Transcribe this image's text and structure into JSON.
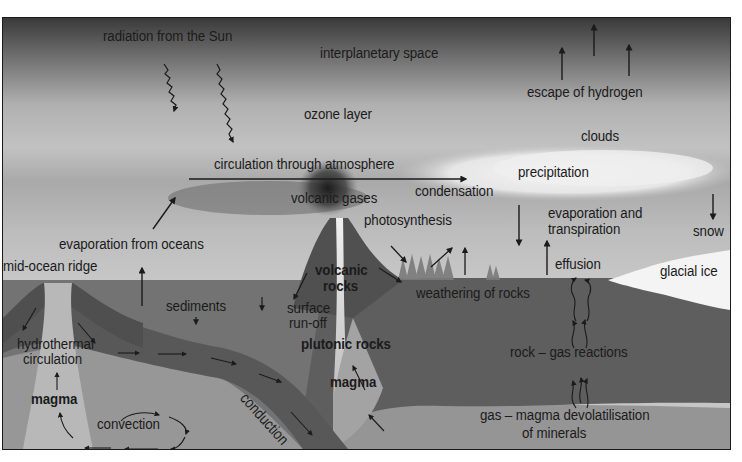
{
  "diagram": {
    "layers": {
      "space": "interplanetary space",
      "ozone": "ozone layer",
      "clouds": "clouds"
    },
    "atmosphere_labels": {
      "radiation": "radiation from the Sun",
      "escape": "escape of hydrogen",
      "circulation": "circulation through atmosphere",
      "volcanic_gases": "volcanic gases",
      "condensation": "condensation",
      "precipitation": "precipitation",
      "photosynthesis": "photosynthesis",
      "evaporation_transpiration_1": "evaporation and",
      "evaporation_transpiration_2": "transpiration",
      "snow": "snow",
      "evaporation_oceans": "evaporation from oceans"
    },
    "surface_labels": {
      "mid_ocean_ridge": "mid-ocean ridge",
      "effusion": "effusion",
      "glacial_ice": "glacial ice",
      "weathering": "weathering of rocks",
      "sediments": "sediments",
      "surface_runoff_1": "surface",
      "surface_runoff_2": "run-off"
    },
    "interior_labels": {
      "volcanic_rocks_1": "volcanic",
      "volcanic_rocks_2": "rocks",
      "plutonic_rocks": "plutonic rocks",
      "magma_center": "magma",
      "magma_left": "magma",
      "hydrothermal_1": "hydrothermal",
      "hydrothermal_2": "circulation",
      "convection": "convection",
      "conduction": "conduction",
      "rock_gas": "rock – gas reactions",
      "gas_magma_1": "gas – magma devolatilisation",
      "gas_magma_2": "of minerals"
    },
    "colors": {
      "space_top": "#3a3a3a",
      "sky_mid": "#b5b5b5",
      "sky_low": "#c4c4c4",
      "ocean": "#6e6e6e",
      "crust": "#5a5a5a",
      "mantle": "#8f8f8f",
      "ice": "#f4f4f4",
      "text": "#1b1b1b"
    }
  }
}
